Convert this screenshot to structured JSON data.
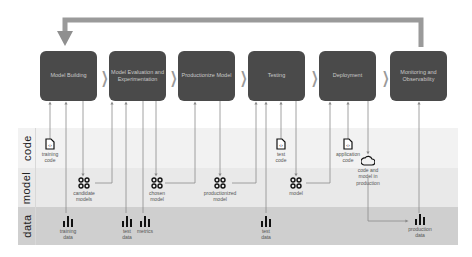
{
  "diagram": {
    "loop_arrow": {
      "from": "Monitoring and Observability",
      "to": "Model Building"
    },
    "stages": [
      {
        "id": "model-building",
        "label": "Model Building"
      },
      {
        "id": "model-evaluation",
        "label": "Model Evaluation and Experimentation"
      },
      {
        "id": "productionize-model",
        "label": "Productionize Model"
      },
      {
        "id": "testing",
        "label": "Testing"
      },
      {
        "id": "deployment",
        "label": "Deployment"
      },
      {
        "id": "monitoring",
        "label": "Monitoring and Observability"
      }
    ],
    "bands": [
      {
        "id": "code",
        "label": "code"
      },
      {
        "id": "model",
        "label": "model"
      },
      {
        "id": "data",
        "label": "data"
      }
    ],
    "artifacts": {
      "training_code": {
        "label_1": "training",
        "label_2": "code",
        "icon": "code-file-icon"
      },
      "test_code": {
        "label_1": "test",
        "label_2": "code",
        "icon": "code-file-icon"
      },
      "application_code": {
        "label_1": "application",
        "label_2": "code",
        "icon": "code-file-icon"
      },
      "candidate_models": {
        "label_1": "candidate",
        "label_2": "models",
        "icon": "model-icon"
      },
      "chosen_model": {
        "label_1": "chosen",
        "label_2": "model",
        "icon": "model-icon"
      },
      "productionized_model": {
        "label_1": "productionized",
        "label_2": "model",
        "icon": "model-icon"
      },
      "model": {
        "label_1": "model",
        "icon": "model-icon"
      },
      "code_and_model_in_production": {
        "label_1": "code and",
        "label_2": "model  in",
        "label_3": "production",
        "icon": "cloud-icon"
      },
      "training_data": {
        "label_1": "training",
        "label_2": "data",
        "icon": "bar-chart-icon"
      },
      "test_data_eval": {
        "label_1": "test",
        "label_2": "data",
        "icon": "bar-chart-icon"
      },
      "metrics": {
        "label_1": "metrics",
        "icon": "bar-chart-icon"
      },
      "test_data_testing": {
        "label_1": "test",
        "label_2": "data",
        "icon": "bar-chart-icon"
      },
      "production_data": {
        "label_1": "production",
        "label_2": "data",
        "icon": "bar-chart-icon"
      }
    },
    "colors": {
      "stage_fill": "#4a4a4a",
      "stage_text": "#c9c9c9",
      "arrow": "#8a8a8a",
      "band_code": "#f2f2f2",
      "band_model": "#e9e9e9",
      "band_data": "#cfcfcf"
    }
  }
}
